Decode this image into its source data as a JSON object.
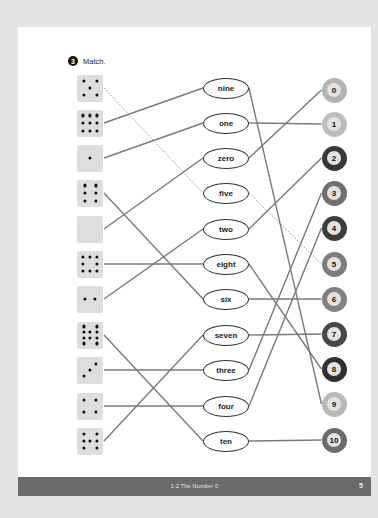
{
  "exercise": {
    "number": "3",
    "instruction": "Match."
  },
  "dice": [
    {
      "count": 5,
      "y": 88
    },
    {
      "count": 9,
      "y": 123
    },
    {
      "count": 1,
      "y": 158
    },
    {
      "count": 6,
      "y": 193
    },
    {
      "count": 0,
      "y": 229
    },
    {
      "count": 8,
      "y": 264
    },
    {
      "count": 2,
      "y": 299
    },
    {
      "count": 10,
      "y": 335
    },
    {
      "count": 3,
      "y": 370
    },
    {
      "count": 4,
      "y": 406
    },
    {
      "count": 7,
      "y": 441
    }
  ],
  "words": [
    {
      "label": "nine",
      "y": 88
    },
    {
      "label": "one",
      "y": 123
    },
    {
      "label": "zero",
      "y": 158
    },
    {
      "label": "five",
      "y": 193
    },
    {
      "label": "two",
      "y": 229
    },
    {
      "label": "eight",
      "y": 264
    },
    {
      "label": "six",
      "y": 299
    },
    {
      "label": "seven",
      "y": 335
    },
    {
      "label": "three",
      "y": 370
    },
    {
      "label": "four",
      "y": 406
    },
    {
      "label": "ten",
      "y": 441
    }
  ],
  "numbers": [
    {
      "label": "0",
      "y": 90,
      "ring": "#b3b3b3"
    },
    {
      "label": "1",
      "y": 124,
      "ring": "#bdbdbd"
    },
    {
      "label": "2",
      "y": 158,
      "ring": "#383838"
    },
    {
      "label": "3",
      "y": 193,
      "ring": "#6f6f6f"
    },
    {
      "label": "4",
      "y": 228,
      "ring": "#3c3c3c"
    },
    {
      "label": "5",
      "y": 264,
      "ring": "#7d7d7d"
    },
    {
      "label": "6",
      "y": 299,
      "ring": "#828282"
    },
    {
      "label": "7",
      "y": 334,
      "ring": "#474747"
    },
    {
      "label": "8",
      "y": 369,
      "ring": "#303030"
    },
    {
      "label": "9",
      "y": 404,
      "ring": "#b9b9b9"
    },
    {
      "label": "10",
      "y": 440,
      "ring": "#6b6b6b"
    }
  ],
  "dice_to_word": [
    {
      "die": 0,
      "word": 3,
      "style": "dashed"
    },
    {
      "die": 1,
      "word": 0
    },
    {
      "die": 2,
      "word": 1
    },
    {
      "die": 3,
      "word": 6
    },
    {
      "die": 4,
      "word": 2
    },
    {
      "die": 5,
      "word": 5
    },
    {
      "die": 6,
      "word": 4
    },
    {
      "die": 7,
      "word": 10
    },
    {
      "die": 8,
      "word": 8
    },
    {
      "die": 9,
      "word": 9
    },
    {
      "die": 10,
      "word": 7
    }
  ],
  "word_to_number": [
    {
      "word": 0,
      "number": 9
    },
    {
      "word": 1,
      "number": 1
    },
    {
      "word": 2,
      "number": 0
    },
    {
      "word": 3,
      "number": 5,
      "style": "dashed"
    },
    {
      "word": 4,
      "number": 2
    },
    {
      "word": 5,
      "number": 8
    },
    {
      "word": 6,
      "number": 6
    },
    {
      "word": 7,
      "number": 7
    },
    {
      "word": 8,
      "number": 3
    },
    {
      "word": 9,
      "number": 4
    },
    {
      "word": 10,
      "number": 10
    }
  ],
  "footer": {
    "title": "1-2  The Number 0",
    "page": "5"
  },
  "colors": {
    "line": "#7a7a7a",
    "die_bg": "#dedede",
    "footer_bg": "#6a6a6a"
  }
}
